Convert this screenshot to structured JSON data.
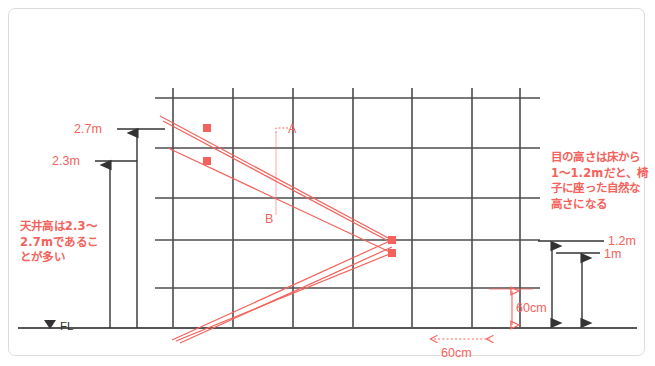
{
  "diagram": {
    "colors": {
      "red": "#f4625c",
      "grid": "#4c4c4c",
      "floor": "#555555",
      "border": "#dcdcdc",
      "background": "#ffffff"
    },
    "labels": {
      "ceiling_high": "2.7m",
      "ceiling_low": "2.3m",
      "floor_level": "FL",
      "floor_level_marker": "▼",
      "eye_high": "1.2m",
      "eye_low": "1m",
      "grid_cell_vertical": "60cm",
      "grid_cell_horizontal": "60cm",
      "point_a": "A",
      "point_b": "B"
    },
    "notes": {
      "left": [
        "天井高は2.3〜",
        "2.7mであるこ",
        "とが多い"
      ],
      "right": [
        "目の高さは床から",
        "1〜1.2mだと、椅",
        "子に座った自然な",
        "高さになる"
      ]
    },
    "geometry": {
      "grid_verticals_x": [
        173,
        233,
        293,
        353,
        412,
        472,
        520
      ],
      "grid_horizontals_y": [
        98,
        148,
        198,
        240,
        288,
        328
      ],
      "grid_left_x": 155,
      "grid_right_x": 540,
      "floor_y": 328,
      "vanishing_points": [
        {
          "x": 392,
          "y": 240
        },
        {
          "x": 392,
          "y": 253
        }
      ],
      "marker_points": [
        {
          "x": 207,
          "y": 128
        },
        {
          "x": 207,
          "y": 161
        }
      ]
    }
  }
}
